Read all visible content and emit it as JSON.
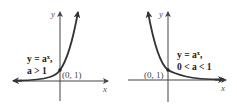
{
  "graphs": [
    {
      "id": "growth",
      "label_line1": "y = a",
      "label_exp": "x",
      "label_comma": ",",
      "label_line2": "a > 1",
      "point_label": "(0, 1)",
      "x_axis_label": "x",
      "y_axis_label": "y",
      "base_condition": "a > 1",
      "function": "a^x"
    },
    {
      "id": "decay",
      "label_line1": "y = a",
      "label_exp": "x",
      "label_comma": ",",
      "label_line2": "0 < a < 1",
      "point_label": "(0, 1)",
      "x_axis_label": "x",
      "y_axis_label": "y",
      "base_condition": "0 < a < 1",
      "function": "a^x"
    }
  ],
  "colors": {
    "curve": "#333333",
    "axis": "#444444",
    "text": "#222222"
  }
}
